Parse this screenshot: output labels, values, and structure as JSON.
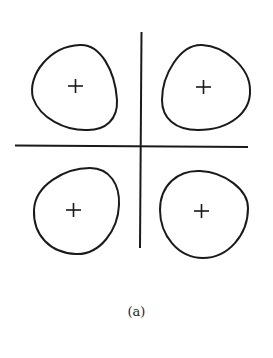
{
  "figure": {
    "caption": "(a)",
    "lobes": [
      {
        "position": "top-left",
        "sign": "+"
      },
      {
        "position": "top-right",
        "sign": "+"
      },
      {
        "position": "bottom-left",
        "sign": "+"
      },
      {
        "position": "bottom-right",
        "sign": "+"
      }
    ],
    "stroke_color": "#1a1a1a"
  }
}
